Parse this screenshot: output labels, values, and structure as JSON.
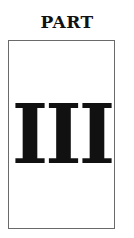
{
  "heading": "PART",
  "numeral": "III",
  "colors": {
    "text": "#111111",
    "border": "#6a6a6a",
    "background": "#ffffff"
  }
}
